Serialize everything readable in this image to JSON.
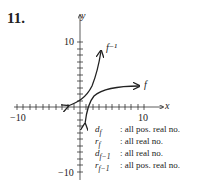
{
  "problem_number": "11.",
  "axes": {
    "x_label": "x",
    "y_label": "y",
    "x_min_label": "−10",
    "x_max_label": "10",
    "y_max_label": "10",
    "y_min_label": "−10"
  },
  "curves": [
    {
      "name": "f",
      "label": "f"
    },
    {
      "name": "f_inverse",
      "label": "f⁻¹"
    }
  ],
  "legend": [
    {
      "symbol": "d_f",
      "sym": "d",
      "sub": "f",
      "value": "all pos. real no."
    },
    {
      "symbol": "r_f",
      "sym": "r",
      "sub": "f",
      "value": "all real no."
    },
    {
      "symbol": "d_f-1",
      "sym": "d",
      "sub": "f−1",
      "value": "all real no."
    },
    {
      "symbol": "r_f-1",
      "sym": "r",
      "sub": "f−1",
      "value": "all pos. real no."
    }
  ]
}
